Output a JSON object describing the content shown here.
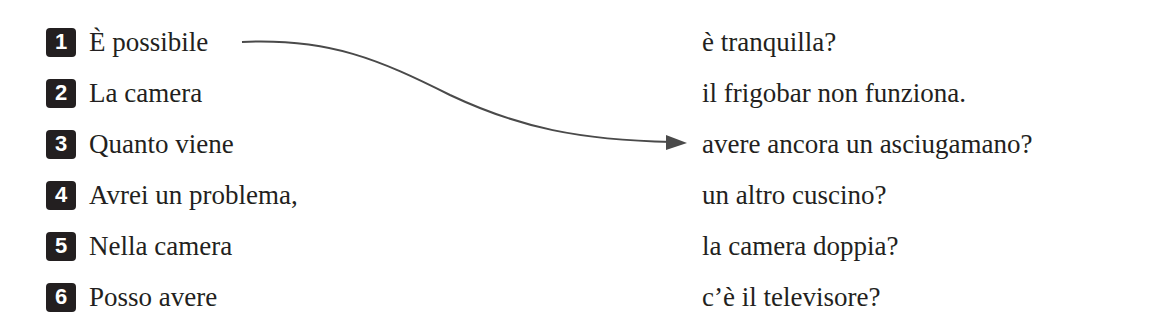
{
  "exercise": {
    "left_items": [
      {
        "number": "1",
        "text": "È possibile"
      },
      {
        "number": "2",
        "text": "La camera"
      },
      {
        "number": "3",
        "text": "Quanto viene"
      },
      {
        "number": "4",
        "text": "Avrei un problema,"
      },
      {
        "number": "5",
        "text": "Nella camera"
      },
      {
        "number": "6",
        "text": "Posso avere"
      }
    ],
    "right_items": [
      "è tranquilla?",
      "il frigobar non funziona.",
      "avere ancora un asciugamano?",
      "un altro cuscino?",
      "la camera doppia?",
      "c’è il televisore?"
    ],
    "example_match": {
      "from": "1",
      "to": "avere ancora un asciugamano?"
    },
    "colors": {
      "text": "#231f20",
      "arrow": "#4a4a4a"
    }
  }
}
